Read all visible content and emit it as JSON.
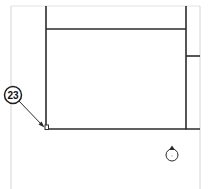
{
  "diagram": {
    "type": "technical-line-drawing",
    "colors": {
      "background": "#ffffff",
      "frame": "#d4d4d4",
      "line": "#2b2b2b",
      "callout_fill": "#ffffff"
    },
    "callouts": [
      {
        "label": "23",
        "target": "corner-marker"
      }
    ],
    "symbols": [
      {
        "name": "circle-arrow-symbol",
        "description": "small circle with arrowhead on top"
      }
    ]
  }
}
